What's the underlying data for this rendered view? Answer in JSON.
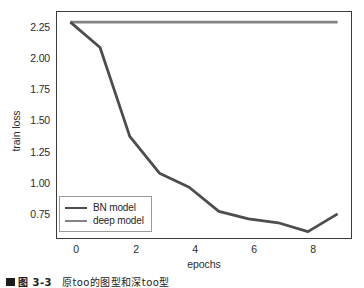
{
  "chart_data": {
    "type": "line",
    "title": "",
    "xlabel": "epochs",
    "ylabel": "train loss",
    "xlim": [
      -0.45,
      9.45
    ],
    "ylim": [
      0.6,
      2.38
    ],
    "xticks": [
      0,
      2,
      4,
      6,
      8
    ],
    "xtick_labels": [
      "0",
      "2",
      "4",
      "6",
      "8"
    ],
    "yticks": [
      0.75,
      1.0,
      1.25,
      1.5,
      1.75,
      2.0,
      2.25
    ],
    "ytick_labels": [
      "0.75",
      "1.00",
      "1.25",
      "1.50",
      "1.75",
      "2.00",
      "2.25"
    ],
    "grid": false,
    "legend_position": "lower left",
    "x": [
      0,
      1,
      2,
      3,
      4,
      5,
      6,
      7,
      8,
      9
    ],
    "series": [
      {
        "name": "BN model",
        "color": "#4d4d4d",
        "values": [
          2.3,
          2.1,
          1.4,
          1.11,
          1.0,
          0.81,
          0.75,
          0.72,
          0.65,
          0.79
        ]
      },
      {
        "name": "deep model",
        "color": "#838383",
        "values": [
          2.3,
          2.3,
          2.3,
          2.3,
          2.3,
          2.3,
          2.3,
          2.3,
          2.3,
          2.3
        ]
      }
    ]
  },
  "legend": {
    "entries": [
      {
        "label": "BN model",
        "color": "#4d4d4d"
      },
      {
        "label": "deep model",
        "color": "#838383"
      }
    ]
  },
  "caption": {
    "marker": "",
    "figure_number": "图 3-3",
    "text": "原too的图型和深too型"
  }
}
